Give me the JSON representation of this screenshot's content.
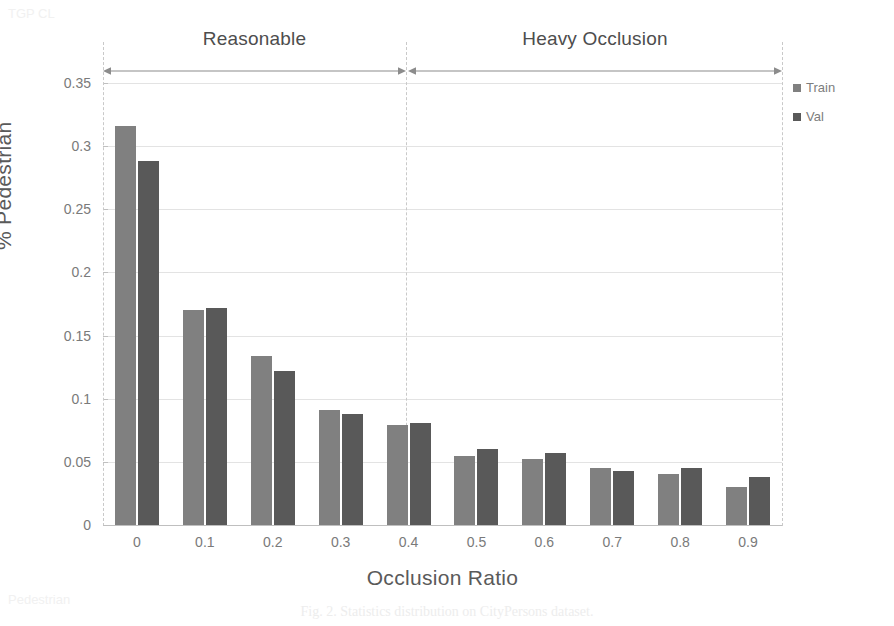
{
  "figure": {
    "caption": "Fig. 2.  Statistics distribution on CityPersons dataset."
  },
  "legend": {
    "position": "right",
    "items": [
      {
        "label": "Train",
        "color": "#808080",
        "marker": "square-swatch-icon"
      },
      {
        "label": "Val",
        "color": "#595959",
        "marker": "square-swatch-icon"
      }
    ]
  },
  "annotations": {
    "bands": [
      {
        "label": "Reasonable",
        "from": 0.0,
        "to": 0.35,
        "arrow": "double-headed-arrow-icon"
      },
      {
        "label": "Heavy Occlusion",
        "from": 0.35,
        "to": 0.95,
        "arrow": "double-headed-arrow-icon"
      }
    ]
  },
  "bleed_text": [
    {
      "text": "TGP CL",
      "x": 8,
      "y": 6
    },
    {
      "text": "Pedestrian",
      "x": 8,
      "y": 594
    }
  ],
  "chart_data": {
    "type": "bar",
    "title": "",
    "subtitle": "",
    "xlabel": "Occlusion Ratio",
    "ylabel": "% Pedestrian",
    "categories": [
      "0",
      "0.1",
      "0.2",
      "0.3",
      "0.4",
      "0.5",
      "0.6",
      "0.7",
      "0.8",
      "0.9"
    ],
    "series": [
      {
        "name": "Train",
        "color": "#808080",
        "values": [
          0.316,
          0.17,
          0.134,
          0.091,
          0.079,
          0.055,
          0.052,
          0.045,
          0.04,
          0.03
        ]
      },
      {
        "name": "Val",
        "color": "#595959",
        "values": [
          0.288,
          0.172,
          0.122,
          0.088,
          0.081,
          0.06,
          0.057,
          0.043,
          0.045,
          0.038
        ]
      }
    ],
    "ylim": [
      0,
      0.35
    ],
    "ytick_labels": [
      "0",
      "0.05",
      "0.1",
      "0.15",
      "0.2",
      "0.25",
      "0.3",
      "0.35"
    ],
    "ytick_values": [
      0,
      0.05,
      0.1,
      0.15,
      0.2,
      0.25,
      0.3,
      0.35
    ],
    "grid": true,
    "grid_axis": "y",
    "legend_position": "right",
    "annotation_divider_at": "0.35"
  }
}
